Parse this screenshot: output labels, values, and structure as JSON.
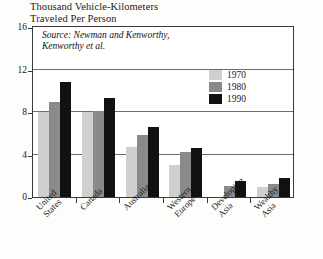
{
  "chart_data": {
    "type": "bar",
    "title": "Thousand Vehicle-Kilometers Traveled Per Person",
    "title_line1": "Thousand Vehicle-Kilometers",
    "title_line2": "Traveled Per Person",
    "source_line1": "Source: Newman and Kenworthy,",
    "source_line2": "Kenworthy et al.",
    "xlabel": "",
    "ylabel": "",
    "ylim": [
      0,
      16
    ],
    "yticks": [
      0,
      4,
      8,
      12,
      16
    ],
    "grid": true,
    "legend_position": "inside-top-right",
    "categories": [
      "United States",
      "Canada",
      "Australia",
      "Western Europe",
      "Developing Asia",
      "Wealthy Asia"
    ],
    "category_lines": [
      [
        "United",
        "States"
      ],
      [
        "Canada",
        ""
      ],
      [
        "Australia",
        ""
      ],
      [
        "Western",
        "Europe"
      ],
      [
        "Developing",
        "Asia"
      ],
      [
        "Wealthy",
        "Asia"
      ]
    ],
    "series": [
      {
        "name": "1970",
        "color": "#cfcfcf",
        "values": [
          8.0,
          8.0,
          4.7,
          3.0,
          0.0,
          0.9
        ]
      },
      {
        "name": "1980",
        "color": "#8a8a8a",
        "values": [
          8.9,
          8.1,
          5.8,
          4.2,
          1.0,
          1.2
        ]
      },
      {
        "name": "1990",
        "color": "#111111",
        "values": [
          10.8,
          9.3,
          6.6,
          4.6,
          1.5,
          1.8
        ]
      }
    ]
  },
  "colors": {
    "frame": "#3a3a3a",
    "grid": "#6e6e6e",
    "background": "#fdfdfb",
    "plot_background": "#ffffff",
    "text": "#1a1a1a"
  }
}
